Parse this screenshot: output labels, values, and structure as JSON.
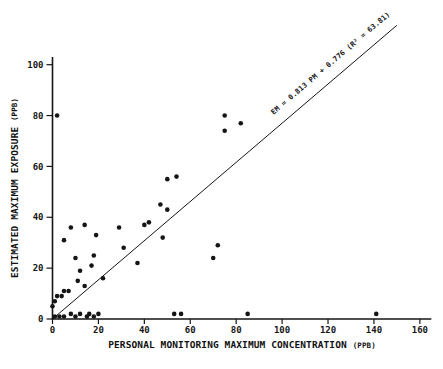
{
  "figure": {
    "background": "#ffffff",
    "ink_color": "#151515"
  },
  "chart_data": {
    "type": "scatter",
    "title": "",
    "xlabel": "PERSONAL MONITORING MAXIMUM CONCENTRATION",
    "xlabel_unit": "(PPB)",
    "ylabel": "ESTIMATED MAXIMUM EXPOSURE",
    "ylabel_unit": "(PPB)",
    "xlim": [
      0,
      165
    ],
    "ylim": [
      0,
      103
    ],
    "x_ticks": [
      0,
      20,
      40,
      60,
      80,
      100,
      120,
      140,
      160
    ],
    "y_ticks": [
      0,
      20,
      40,
      60,
      80,
      100
    ],
    "grid": false,
    "legend": "none",
    "points": [
      [
        2,
        80
      ],
      [
        75,
        80
      ],
      [
        82,
        77
      ],
      [
        75,
        74
      ],
      [
        50,
        55
      ],
      [
        54,
        56
      ],
      [
        47,
        45
      ],
      [
        50,
        43
      ],
      [
        40,
        37
      ],
      [
        42,
        38
      ],
      [
        48,
        32
      ],
      [
        29,
        36
      ],
      [
        31,
        28
      ],
      [
        37,
        22
      ],
      [
        72,
        29
      ],
      [
        70,
        24
      ],
      [
        5,
        31
      ],
      [
        8,
        36
      ],
      [
        14,
        37
      ],
      [
        19,
        33
      ],
      [
        18,
        25
      ],
      [
        17,
        21
      ],
      [
        10,
        24
      ],
      [
        12,
        19
      ],
      [
        11,
        15
      ],
      [
        22,
        16
      ],
      [
        14,
        13
      ],
      [
        5,
        11
      ],
      [
        7,
        11
      ],
      [
        2,
        9
      ],
      [
        4,
        9
      ],
      [
        1,
        7
      ],
      [
        0,
        5
      ],
      [
        1,
        1
      ],
      [
        3,
        1
      ],
      [
        5,
        1
      ],
      [
        8,
        2
      ],
      [
        10,
        1
      ],
      [
        12,
        2
      ],
      [
        15,
        1
      ],
      [
        16,
        2
      ],
      [
        18,
        1
      ],
      [
        20,
        2
      ],
      [
        53,
        2
      ],
      [
        56,
        2
      ],
      [
        85,
        2
      ],
      [
        141,
        2
      ]
    ],
    "regression_line": {
      "label": "EM = 0.813 PM + 0.776 (R² = 63.81)",
      "slope": 0.813,
      "intercept": 0.776,
      "r_squared": 63.81,
      "draw_from": [
        0,
        0
      ],
      "draw_to": [
        150,
        115.5
      ]
    }
  }
}
